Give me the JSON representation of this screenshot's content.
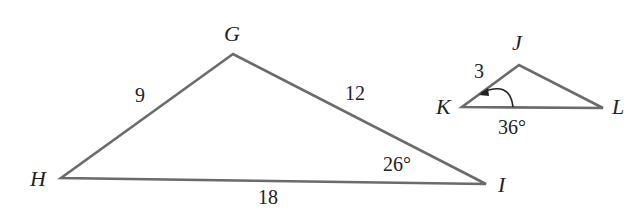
{
  "diagram": {
    "type": "similar-triangles",
    "triangle_ghi": {
      "vertices": {
        "G": {
          "label": "G",
          "x": 233,
          "y": 54
        },
        "H": {
          "label": "H",
          "x": 61,
          "y": 178
        },
        "I": {
          "label": "I",
          "x": 486,
          "y": 184
        }
      },
      "sides": {
        "GH": {
          "label": "9"
        },
        "GI": {
          "label": "12"
        },
        "HI": {
          "label": "18"
        }
      },
      "angles": {
        "I": {
          "label": "26°"
        }
      }
    },
    "triangle_jkl": {
      "vertices": {
        "J": {
          "label": "J",
          "x": 519,
          "y": 65
        },
        "K": {
          "label": "K",
          "x": 462,
          "y": 107
        },
        "L": {
          "label": "L",
          "x": 603,
          "y": 108
        }
      },
      "sides": {
        "JK": {
          "label": "3"
        }
      },
      "angles": {
        "K": {
          "label": "36°"
        }
      }
    },
    "colors": {
      "edge": "#6b6b6b",
      "text": "#222222",
      "background": "#ffffff"
    }
  }
}
